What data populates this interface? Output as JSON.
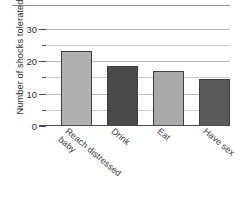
{
  "chart_data": {
    "type": "bar",
    "title": "",
    "subtitle": "",
    "xlabel": "",
    "ylabel": "Number of shocks tolerated",
    "ylim": [
      0,
      32
    ],
    "ytick_values": [
      0,
      10,
      20,
      30
    ],
    "ytick_labels": [
      "0",
      "10",
      "20",
      "30"
    ],
    "yminor_values": [
      5,
      15,
      25
    ],
    "grid": true,
    "legend": "none",
    "categories": [
      "Reach distressed baby",
      "Drink",
      "Eat",
      "Have sex"
    ],
    "category_label_lines": [
      [
        "Reach distressed",
        "baby"
      ],
      [
        "Drink"
      ],
      [
        "Eat"
      ],
      [
        "Have sex"
      ]
    ],
    "values": [
      23,
      18.5,
      17,
      14.5
    ],
    "bar_colors": [
      "#b0b0b0",
      "#4a4a4a",
      "#a9a9a9",
      "#5a5a5a"
    ],
    "bar_edge_color": "#3c3c3c",
    "gridline_color": "#b9b9b9",
    "axis_color": "#4b4b4b",
    "background_color": "#ffffff",
    "annotations": []
  }
}
